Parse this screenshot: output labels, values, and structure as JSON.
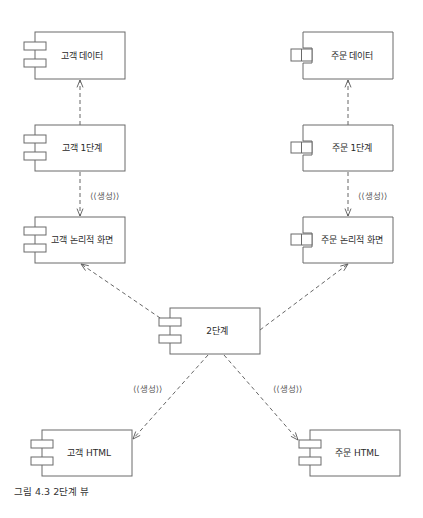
{
  "caption": "그림 4.3 2단계 뷰",
  "stereotype_label": "⟨⟨생성⟩⟩",
  "components": [
    {
      "id": "customer-data",
      "label": "고객 데이터",
      "x": 35,
      "y": 32,
      "w": 90,
      "h": 47,
      "tab_style": "stacked"
    },
    {
      "id": "customer-stage1",
      "label": "고객 1단계",
      "x": 35,
      "y": 125,
      "w": 90,
      "h": 46,
      "tab_style": "stacked"
    },
    {
      "id": "customer-logical-screen",
      "label": "고객 논리적 화면",
      "x": 35,
      "y": 217,
      "w": 90,
      "h": 46,
      "tab_style": "stacked"
    },
    {
      "id": "order-data",
      "label": "주문 데이터",
      "x": 303,
      "y": 32,
      "w": 90,
      "h": 47,
      "tab_style": "notched"
    },
    {
      "id": "order-stage1",
      "label": "주문 1단계",
      "x": 303,
      "y": 125,
      "w": 90,
      "h": 46,
      "tab_style": "notched"
    },
    {
      "id": "order-logical-screen",
      "label": "주문 논리적 화면",
      "x": 303,
      "y": 217,
      "w": 90,
      "h": 46,
      "tab_style": "notched"
    },
    {
      "id": "stage2",
      "label": "2단계",
      "x": 170,
      "y": 308,
      "w": 90,
      "h": 46,
      "tab_style": "stacked"
    },
    {
      "id": "customer-html",
      "label": "고객 HTML",
      "x": 42,
      "y": 430,
      "w": 90,
      "h": 46,
      "tab_style": "stacked"
    },
    {
      "id": "order-html",
      "label": "주문 HTML",
      "x": 310,
      "y": 430,
      "w": 90,
      "h": 46,
      "tab_style": "stacked"
    }
  ],
  "dependencies": [
    {
      "from": "customer-stage1",
      "to": "customer-data",
      "x1": 80,
      "y1": 125,
      "x2": 80,
      "y2": 80,
      "stereotype": false
    },
    {
      "from": "customer-stage1",
      "to": "customer-logical-screen",
      "x1": 80,
      "y1": 172,
      "x2": 80,
      "y2": 216,
      "stereotype": true,
      "label_x": 90,
      "label_y": 199
    },
    {
      "from": "order-stage1",
      "to": "order-data",
      "x1": 348,
      "y1": 125,
      "x2": 348,
      "y2": 80,
      "stereotype": false
    },
    {
      "from": "order-stage1",
      "to": "order-logical-screen",
      "x1": 348,
      "y1": 172,
      "x2": 348,
      "y2": 216,
      "stereotype": true,
      "label_x": 358,
      "label_y": 199
    },
    {
      "from": "stage2",
      "to": "customer-logical-screen",
      "x1": 166,
      "y1": 322,
      "x2": 81,
      "y2": 264,
      "stereotype": false
    },
    {
      "from": "stage2",
      "to": "order-logical-screen",
      "x1": 260,
      "y1": 330,
      "x2": 348,
      "y2": 264,
      "stereotype": false
    },
    {
      "from": "stage2",
      "to": "customer-html",
      "x1": 208,
      "y1": 355,
      "x2": 133,
      "y2": 439,
      "stereotype": true,
      "label_x": 133,
      "label_y": 392
    },
    {
      "from": "stage2",
      "to": "order-html",
      "x1": 224,
      "y1": 355,
      "x2": 298,
      "y2": 440,
      "stereotype": true,
      "label_x": 273,
      "label_y": 392
    }
  ]
}
